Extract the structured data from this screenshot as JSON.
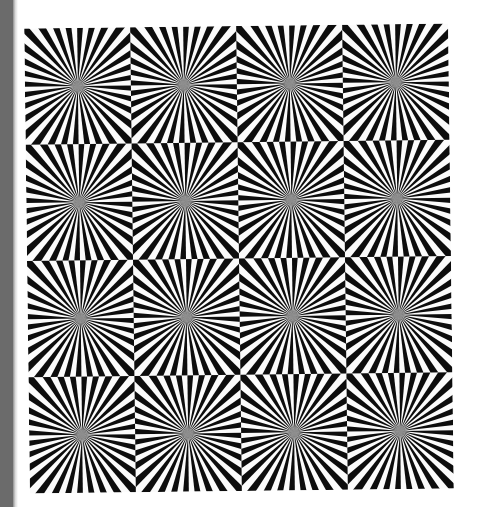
{
  "canvas": {
    "width": 482,
    "height": 507,
    "background_color": "#ffffff"
  },
  "gutter": {
    "label": "left-gutter",
    "color": "#6b6b6b",
    "width": 13,
    "height": 507
  },
  "artwork": {
    "title": "Sunburst tile optical illusion",
    "alt_text": "Grid of square tiles each filled with a radial black-and-white sunburst",
    "x": 27,
    "y": 26,
    "width": 424,
    "height": 465,
    "rotation_deg": -0.7,
    "colors": {
      "ink": "#0d0d0d",
      "paper": "#fbfbfb",
      "center_haze": "#8a8a8a"
    }
  },
  "chart_data": {
    "type": "heatmap",
    "title": "Sunburst tile optical illusion",
    "xlabel": "",
    "ylabel": "",
    "grid": {
      "columns": 4,
      "rows": 4,
      "tile_width": 106,
      "tile_height": 116.25
    },
    "tile": {
      "ray_count": 32,
      "ray_pairs": 16,
      "duty_cycle": 0.5,
      "origin": "tile-center",
      "sweep_deg": 360,
      "start_angle_deg": 0,
      "center_haze_radius": 9
    },
    "categories": [
      "col-1",
      "col-2",
      "col-3",
      "col-4"
    ],
    "series": [
      {
        "name": "row-1",
        "values": [
          32,
          32,
          32,
          32
        ]
      },
      {
        "name": "row-2",
        "values": [
          32,
          32,
          32,
          32
        ]
      },
      {
        "name": "row-3",
        "values": [
          32,
          32,
          32,
          32
        ]
      },
      {
        "name": "row-4",
        "values": [
          32,
          32,
          32,
          32
        ]
      }
    ],
    "legend": [],
    "annotations": []
  }
}
